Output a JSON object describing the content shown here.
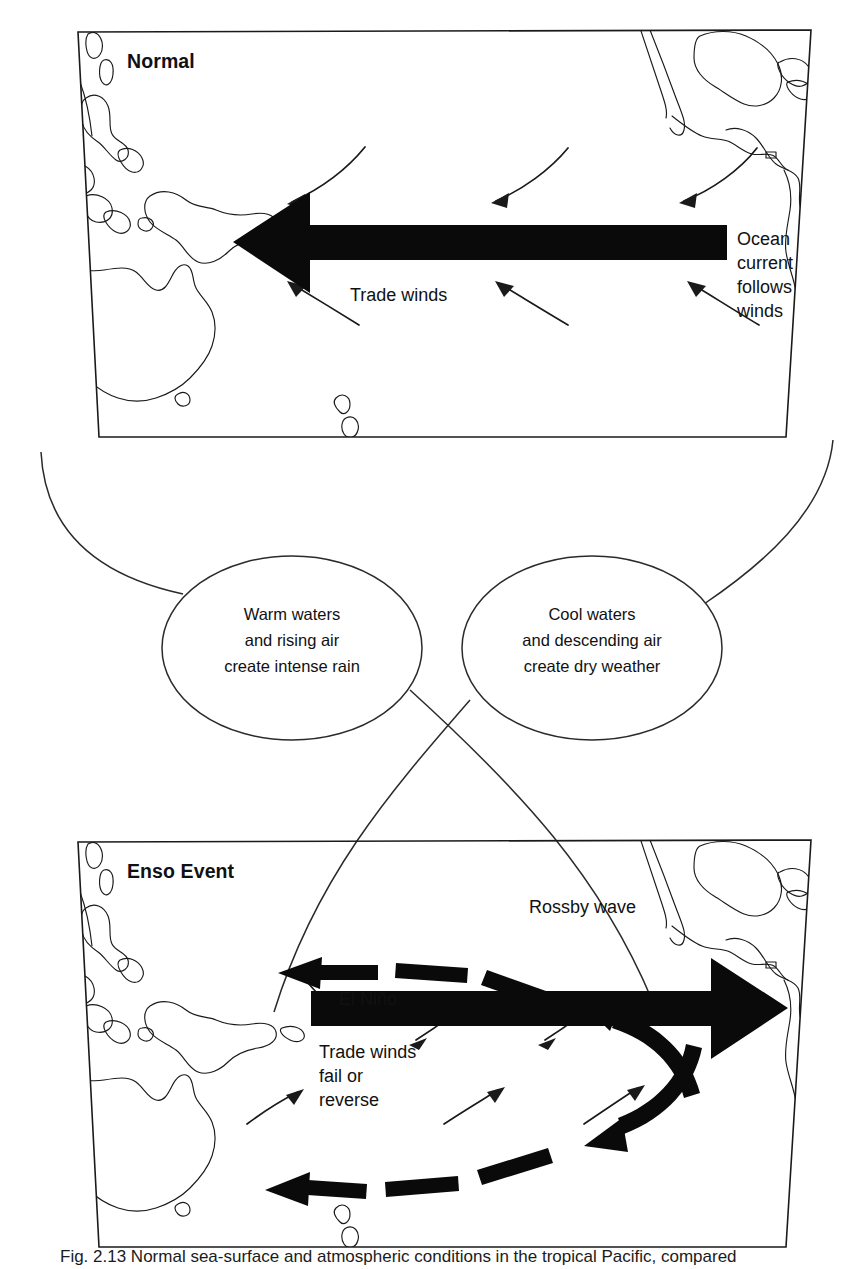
{
  "figure": {
    "kind": "enso-schematic-diagram",
    "caption": "Fig. 2.13  Normal sea-surface and atmospheric conditions in the tropical Pacific, compared",
    "ink_color": "#111111",
    "background_color": "#ffffff"
  },
  "top_panel": {
    "title": "Normal",
    "labels": {
      "trade_winds": "Trade winds",
      "ocean_current_l1": "Ocean",
      "ocean_current_l2": "current",
      "ocean_current_l3": "follows",
      "ocean_current_l4": "winds"
    },
    "main_arrow_direction": "west",
    "wind_arrow_count": 6
  },
  "bubbles": {
    "left": {
      "line1": "Warm waters",
      "line2": "and rising air",
      "line3": "create intense rain"
    },
    "right": {
      "line1": "Cool waters",
      "line2": "and descending air",
      "line3": "create dry weather"
    }
  },
  "bottom_panel": {
    "title": "Enso Event",
    "labels": {
      "rossby_wave": "Rossby wave",
      "el_nino": "El Niño",
      "trade_winds_l1": "Trade winds",
      "trade_winds_l2": "fail or",
      "trade_winds_l3": "reverse"
    },
    "main_arrow_direction": "east",
    "wind_arrow_count": 6,
    "dashed_arrow_count": 2
  }
}
